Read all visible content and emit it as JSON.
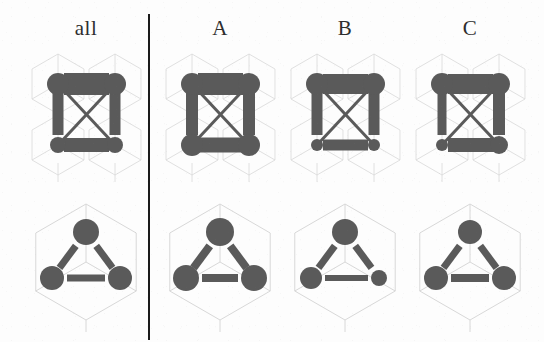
{
  "figure": {
    "type": "lattice-graph-panel",
    "background_color": "#fdfdfd",
    "lattice_color": "#d8d8d8",
    "element_color": "#5a5a5a",
    "divider_color": "#1b1b1b",
    "rows": 2,
    "columns": 4
  },
  "headers": {
    "all": "all",
    "a": "A",
    "b": "B",
    "c": "C"
  },
  "chart_data": {
    "type": "diagram",
    "title": "",
    "xlabel": "",
    "ylabel": "",
    "column_labels": [
      "all",
      "A",
      "B",
      "C"
    ],
    "row_labels": [
      "square-lattice-graph",
      "hexagonal-cube-triangle-graph"
    ],
    "legend": [],
    "row1": {
      "name": "square-lattice-graph",
      "nodes": [
        {
          "id": "top-left",
          "x": 0,
          "y": 1
        },
        {
          "id": "top-right",
          "x": 1,
          "y": 1
        },
        {
          "id": "bottom-left",
          "x": 0,
          "y": 0
        },
        {
          "id": "bottom-right",
          "x": 1,
          "y": 0
        }
      ],
      "edges": [
        {
          "from": "top-left",
          "to": "top-right",
          "kind": "horizontal-top"
        },
        {
          "from": "bottom-left",
          "to": "bottom-right",
          "kind": "horizontal-bottom"
        },
        {
          "from": "top-left",
          "to": "bottom-left",
          "kind": "vertical-left"
        },
        {
          "from": "top-right",
          "to": "bottom-right",
          "kind": "vertical-right"
        },
        {
          "from": "top-left",
          "to": "bottom-right",
          "kind": "diagonal-down"
        },
        {
          "from": "bottom-left",
          "to": "top-right",
          "kind": "diagonal-up"
        }
      ],
      "series": [
        {
          "name": "all",
          "node_radius": {
            "top-left": 11,
            "top-right": 11,
            "bottom-left": 8,
            "bottom-right": 8
          },
          "edge_width": {
            "horizontal-top": 22,
            "horizontal-bottom": 14,
            "vertical-left": 11,
            "vertical-right": 11,
            "diagonal-down": 3,
            "diagonal-up": 3
          }
        },
        {
          "name": "A",
          "node_radius": {
            "top-left": 11,
            "top-right": 11,
            "bottom-left": 11,
            "bottom-right": 11
          },
          "edge_width": {
            "horizontal-top": 22,
            "horizontal-bottom": 15,
            "vertical-left": 12,
            "vertical-right": 12,
            "diagonal-down": 3,
            "diagonal-up": 3
          }
        },
        {
          "name": "B",
          "node_radius": {
            "top-left": 11,
            "top-right": 11,
            "bottom-left": 6,
            "bottom-right": 6
          },
          "edge_width": {
            "horizontal-top": 20,
            "horizontal-bottom": 11,
            "vertical-left": 11,
            "vertical-right": 11,
            "diagonal-down": 3,
            "diagonal-up": 3
          }
        },
        {
          "name": "C",
          "node_radius": {
            "top-left": 11,
            "top-right": 11,
            "bottom-left": 6,
            "bottom-right": 9
          },
          "edge_width": {
            "horizontal-top": 20,
            "horizontal-bottom": 14,
            "vertical-left": 9,
            "vertical-right": 12,
            "diagonal-down": 3,
            "diagonal-up": 3
          }
        }
      ]
    },
    "row2": {
      "name": "hexagonal-cube-triangle-graph",
      "nodes": [
        {
          "id": "apex",
          "x": 0.5,
          "y": 1
        },
        {
          "id": "bottom-left",
          "x": 0,
          "y": 0
        },
        {
          "id": "bottom-right",
          "x": 1,
          "y": 0
        }
      ],
      "edges": [
        {
          "from": "apex",
          "to": "bottom-left",
          "kind": "left-slant"
        },
        {
          "from": "apex",
          "to": "bottom-right",
          "kind": "right-slant"
        },
        {
          "from": "bottom-left",
          "to": "bottom-right",
          "kind": "base"
        }
      ],
      "series": [
        {
          "name": "all",
          "node_radius": {
            "apex": 13,
            "bottom-left": 12,
            "bottom-right": 12
          },
          "edge_width": {
            "left-slant": 7,
            "right-slant": 7,
            "base": 7
          }
        },
        {
          "name": "A",
          "node_radius": {
            "apex": 14,
            "bottom-left": 13,
            "bottom-right": 13
          },
          "edge_width": {
            "left-slant": 8,
            "right-slant": 8,
            "base": 8
          }
        },
        {
          "name": "B",
          "node_radius": {
            "apex": 13,
            "bottom-left": 11,
            "bottom-right": 8
          },
          "edge_width": {
            "left-slant": 7,
            "right-slant": 7,
            "base": 6
          }
        },
        {
          "name": "C",
          "node_radius": {
            "apex": 12,
            "bottom-left": 12,
            "bottom-right": 12
          },
          "edge_width": {
            "left-slant": 7,
            "right-slant": 7,
            "base": 8
          }
        }
      ]
    }
  }
}
